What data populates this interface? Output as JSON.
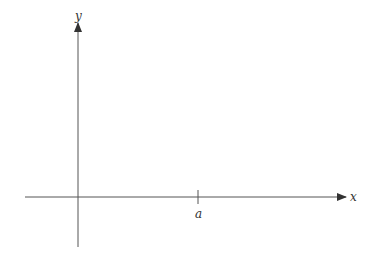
{
  "diagram": {
    "type": "coordinate-axes",
    "axes": {
      "x_label": "x",
      "y_label": "y"
    },
    "tick_marks": [
      {
        "axis": "x",
        "label": "a"
      }
    ],
    "colors": {
      "axis": "#555555",
      "text": "#333333",
      "background": "#ffffff"
    }
  }
}
